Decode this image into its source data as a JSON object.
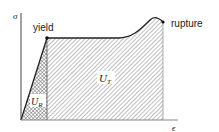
{
  "diagram": {
    "axes": {
      "y_label": "σ",
      "x_label": "ϵ"
    },
    "points": {
      "yield_label": "yield",
      "rupture_label": "rupture"
    },
    "regions": {
      "resilience": {
        "label_main": "U",
        "label_sub": "R",
        "pattern": "cross-hatch"
      },
      "toughness": {
        "label_main": "U",
        "label_sub": "T",
        "pattern": "diagonal-hatch"
      }
    },
    "colors": {
      "line": "#222222",
      "hatch": "#8a8a8a",
      "background": "#ffffff"
    }
  }
}
